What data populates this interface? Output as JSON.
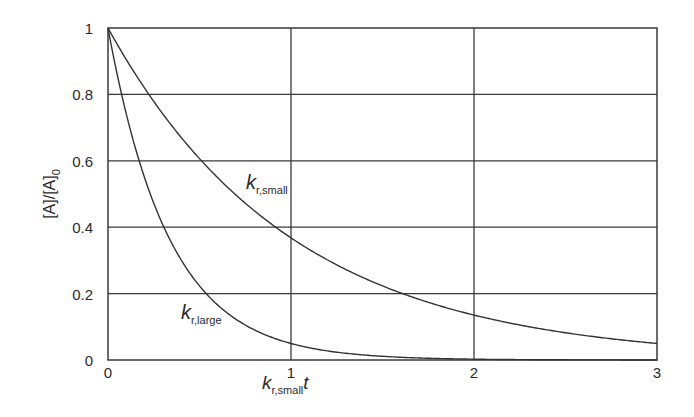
{
  "chart_data": {
    "type": "line",
    "title": "",
    "xlabel": "k_r,small t",
    "xlabel_parts": {
      "main": "k",
      "sub": "r,small",
      "suffix": "t"
    },
    "ylabel": "[A]/[A]_0",
    "ylabel_parts": {
      "main": "[A]/[A]",
      "sub": "0"
    },
    "xlim": [
      0,
      3
    ],
    "ylim": [
      0,
      1
    ],
    "xticks": [
      "0",
      "1",
      "2",
      "3"
    ],
    "yticks": [
      "0",
      "0.2",
      "0.4",
      "0.6",
      "0.8",
      "1"
    ],
    "grid": true,
    "legend": "none (curves labelled inline)",
    "x": [
      0,
      0.25,
      0.5,
      0.75,
      1.0,
      1.5,
      2.0,
      2.5,
      3.0
    ],
    "series": [
      {
        "name": "k_r,small",
        "label_parts": {
          "main": "k",
          "sub": "r,small"
        },
        "formula": "exp(-t)",
        "values": [
          1.0,
          0.78,
          0.61,
          0.47,
          0.37,
          0.22,
          0.14,
          0.08,
          0.05
        ]
      },
      {
        "name": "k_r,large",
        "label_parts": {
          "main": "k",
          "sub": "r,large"
        },
        "formula": "exp(-3t)",
        "values": [
          1.0,
          0.47,
          0.22,
          0.11,
          0.05,
          0.01,
          0.0,
          0.0,
          0.0
        ]
      }
    ]
  }
}
